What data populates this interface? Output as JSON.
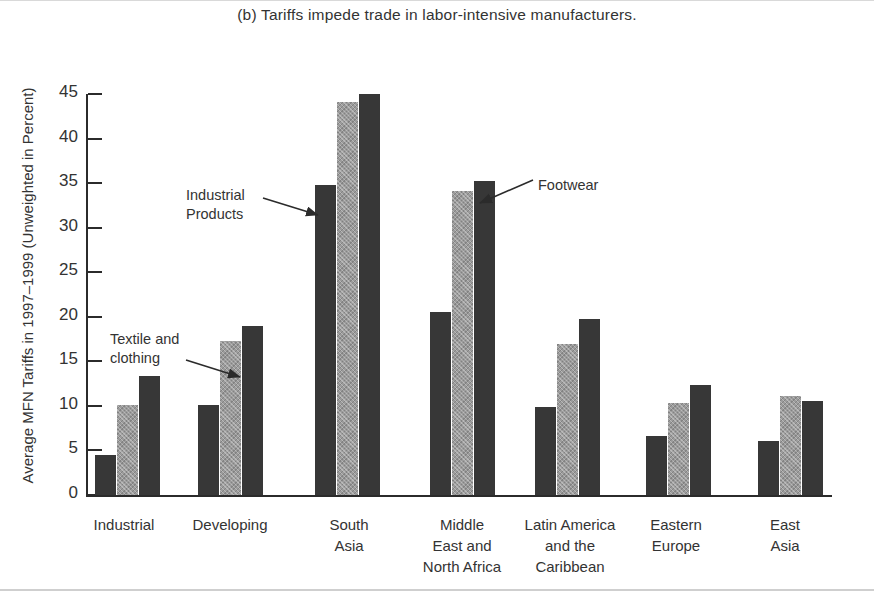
{
  "chart_data": {
    "type": "bar",
    "title": "(b) Tariffs impede trade in labor-intensive manufacturers.",
    "xlabel": "",
    "ylabel": "Average MFN Tariffs in 1997–1999 (Unweighted in Percent)",
    "ylim": [
      0,
      45
    ],
    "yticks": [
      0,
      5,
      10,
      15,
      20,
      25,
      30,
      35,
      40,
      45
    ],
    "grid": false,
    "legend": "none (series identified by in-plot annotations)",
    "categories": [
      "Industrial",
      "Developing",
      "South\nAsia",
      "Middle\nEast and\nNorth Africa",
      "Latin America\nand the\nCaribbean",
      "Eastern\nEurope",
      "East\nAsia"
    ],
    "series": [
      {
        "name": "Industrial Products",
        "color": "#373737",
        "values": [
          4.5,
          10.1,
          34.8,
          20.5,
          9.9,
          6.6,
          6.1
        ]
      },
      {
        "name": "Textile and clothing",
        "color": "#9b9b9b",
        "values": [
          10.1,
          17.3,
          44.1,
          34.1,
          16.9,
          10.3,
          11.1
        ]
      },
      {
        "name": "Footwear",
        "color": "#373737",
        "values": [
          13.3,
          19.0,
          45.0,
          35.2,
          19.8,
          12.3,
          10.5
        ]
      }
    ],
    "annotations": [
      {
        "text": "Textile and\nclothing",
        "target_series": "Textile and clothing",
        "target_category": "Developing"
      },
      {
        "text": "Industrial\nProducts",
        "target_series": "Industrial Products",
        "target_category": "South Asia"
      },
      {
        "text": "Footwear",
        "target_series": "Footwear",
        "target_category": "Middle East and North Africa"
      }
    ]
  },
  "axis": {
    "ticklabels": [
      "45",
      "40",
      "35",
      "30",
      "25",
      "20",
      "15",
      "10",
      "5",
      "0"
    ]
  },
  "annotations": {
    "textile": "Textile and\nclothing",
    "industrial": "Industrial\nProducts",
    "footwear": "Footwear"
  }
}
